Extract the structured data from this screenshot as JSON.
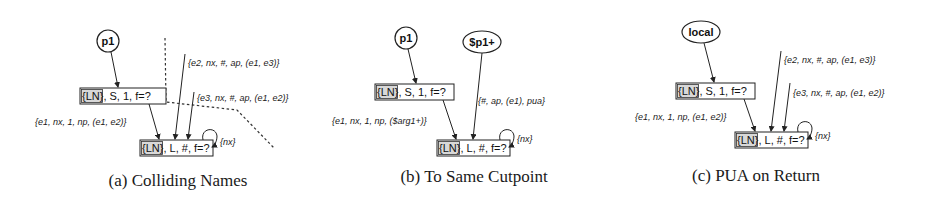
{
  "panels": [
    {
      "id": "a",
      "caption": "(a) Colliding Names",
      "source_node": "p1",
      "node_summary": "{LN}, S, 1, f=?",
      "node_loop": "{LN}, L, #, f=?",
      "highlight": "{LN}",
      "edge_source_to_summary": "",
      "edge_summary_to_loop": "{e1, nx, 1, np, (e1, e2)}",
      "edge_in_1": "{e2, nx, #, ap, (e1, e3)}",
      "edge_in_2": "{e3, nx, #, ap, (e1, e2)}",
      "self_loop": "{nx}",
      "has_dashed_boundary": true
    },
    {
      "id": "b",
      "caption": "(b) To Same Cutpoint",
      "source_node": "p1",
      "second_source_node": "$p1+",
      "node_summary": "{LN}, S, 1, f=?",
      "node_loop": "{LN}, L, #, f=?",
      "highlight": "{LN}",
      "edge_summary_to_loop": "{e1, nx, 1, np, ($arg1+)}",
      "edge_second_source": "{#, ap, (e1), pua}",
      "self_loop": "{nx}"
    },
    {
      "id": "c",
      "caption": "(c) PUA on Return",
      "source_node": "local",
      "node_summary": "{LN}, S, 1, f=?",
      "node_loop": "{LN}, L, #, f=?",
      "highlight": "{LN}",
      "edge_summary_to_loop": "{e1, nx, 1, np, (e1, e2)}",
      "edge_in_1": "{e2, nx, #, ap, (e1, e3)}",
      "edge_in_2": "{e3, nx, #, ap, (e1, e2)}",
      "self_loop": "{nx}"
    }
  ],
  "node_text": {
    "summary_rest": ", S, 1, f=?",
    "loop_rest": ", L, #, f=?"
  }
}
